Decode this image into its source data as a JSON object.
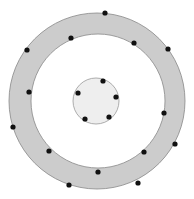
{
  "diagram": {
    "type": "concentric-rings-with-points",
    "colors": {
      "outer_ring_fill": "#cccccc",
      "outer_ring_stroke": "#888888",
      "middle_fill": "#ffffff",
      "inner_fill": "#eeeeee",
      "inner_stroke": "#999999",
      "dot": "#111111"
    },
    "outer_circle": {
      "cx": 97,
      "cy": 101,
      "r": 88
    },
    "middle_circle": {
      "cx": 98,
      "cy": 101,
      "r": 67
    },
    "inner_circle": {
      "cx": 96,
      "cy": 101,
      "r": 23
    },
    "ring_points": [
      [
        105,
        13
      ],
      [
        71,
        38
      ],
      [
        134,
        43
      ],
      [
        27,
        50
      ],
      [
        168,
        49
      ],
      [
        29,
        92
      ],
      [
        164,
        113
      ],
      [
        13,
        127
      ],
      [
        49,
        151
      ],
      [
        144,
        152
      ],
      [
        175,
        144
      ],
      [
        98,
        172
      ],
      [
        69,
        185
      ],
      [
        138,
        183
      ]
    ],
    "inner_points": [
      [
        103,
        81
      ],
      [
        78,
        93
      ],
      [
        116,
        97
      ],
      [
        85,
        119
      ],
      [
        109,
        117
      ]
    ],
    "dot_radius": 2.6
  }
}
